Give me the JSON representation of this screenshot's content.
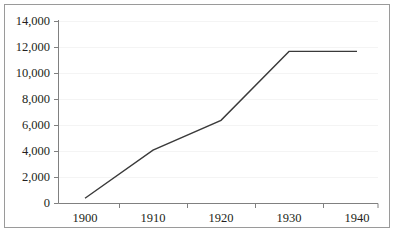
{
  "chart_data": {
    "type": "line",
    "title": "",
    "subtitle": "",
    "xlabel": "",
    "ylabel": "",
    "categories": [
      "1900",
      "1910",
      "1920",
      "1930",
      "1940"
    ],
    "x": [
      1900,
      1910,
      1920,
      1930,
      1940
    ],
    "values": [
      400,
      4100,
      6400,
      11700,
      11700
    ],
    "series": [
      {
        "name": "",
        "values": [
          400,
          4100,
          6400,
          11700,
          11700
        ],
        "color": "#3a3a3a"
      }
    ],
    "ylim": [
      0,
      14000
    ],
    "ytick_values": [
      0,
      2000,
      4000,
      6000,
      8000,
      10000,
      12000,
      14000
    ],
    "ytick_labels": [
      "0",
      "2,000",
      "4,000",
      "6,000",
      "8,000",
      "10,000",
      "12,000",
      "14,000"
    ],
    "xtick_labels": [
      "1900",
      "1910",
      "1920",
      "1930",
      "1940"
    ],
    "grid": "horizontal-faint",
    "legend": "none",
    "markers": "none",
    "line_color": "#3a3a3a",
    "gridline_color": "#f2f2f2",
    "axis_color": "#808080",
    "frame_color": "#9a9a9a",
    "text_color": "#231f20",
    "background": "#ffffff"
  },
  "axes": {
    "y_labels": [
      {
        "text": "14,000",
        "value": 14000
      },
      {
        "text": "12,000",
        "value": 12000
      },
      {
        "text": "10,000",
        "value": 10000
      },
      {
        "text": "8,000",
        "value": 8000
      },
      {
        "text": "6,000",
        "value": 6000
      },
      {
        "text": "4,000",
        "value": 4000
      },
      {
        "text": "2,000",
        "value": 2000
      },
      {
        "text": "0",
        "value": 0
      }
    ],
    "x_labels": [
      {
        "text": "1900"
      },
      {
        "text": "1910"
      },
      {
        "text": "1920"
      },
      {
        "text": "1930"
      },
      {
        "text": "1940"
      }
    ]
  }
}
